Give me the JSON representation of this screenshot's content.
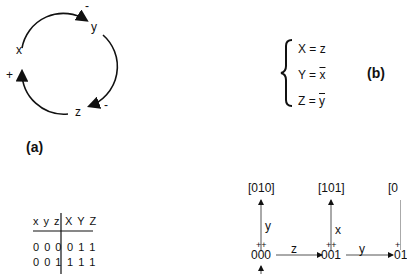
{
  "panel_a": {
    "label": "(a)",
    "nodes": {
      "x": "x",
      "y": "y",
      "z": "z"
    },
    "signs": {
      "x": "+",
      "y": "-",
      "z": "-"
    }
  },
  "panel_b": {
    "label": "(b)",
    "equations": [
      {
        "lhs": "X = ",
        "rhs": "z",
        "overline": false
      },
      {
        "lhs": "Y = ",
        "rhs": "x",
        "overline": true
      },
      {
        "lhs": "Z = ",
        "rhs": "y",
        "overline": true
      }
    ]
  },
  "truth_table": {
    "header_left": "x y z",
    "header_right": "X Y Z",
    "rows": [
      {
        "in": "0 0 0",
        "out": "0 1 1"
      },
      {
        "in": "0 0 1",
        "out": "1 1 1"
      }
    ]
  },
  "state_graph": {
    "states": [
      "000",
      "001",
      "01"
    ],
    "targets": [
      "[010]",
      "[101]",
      "[0"
    ],
    "edge_labels": {
      "up_000": "y",
      "up_001": "x",
      "h_000_001": "z",
      "h_001_01": "y"
    },
    "marks": {
      "000": "++",
      "001": "++",
      "01": "+"
    }
  }
}
